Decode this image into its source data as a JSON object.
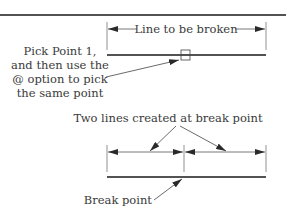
{
  "diagram": {
    "top": {
      "dimension_label": "Line to be broken",
      "callout_lines": [
        "Pick Point 1,",
        "and then use the",
        "@ option to pick",
        "the same point"
      ]
    },
    "bottom": {
      "dimension_label": "Two lines created at break point",
      "callout_label": "Break point"
    },
    "colors": {
      "line": "#1a1a1a",
      "dim_line": "#555555",
      "text": "#3a3a3a"
    }
  }
}
